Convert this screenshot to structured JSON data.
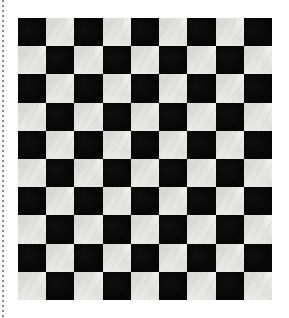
{
  "canvas": {
    "width": 289,
    "height": 318,
    "background_color": "#ffffff"
  },
  "guide_line": {
    "name": "dotted vertical guide",
    "orientation": "vertical",
    "x": 3,
    "y_start": 0,
    "y_end": 318,
    "style": "dotted",
    "color": "#8a8a8a",
    "thickness": 2
  },
  "checkerboard": {
    "title": "Checkerboard tile pattern",
    "columns": 9,
    "rows": 10,
    "cell_size": 28.2,
    "offset_x": 18,
    "offset_y": 18,
    "width": 254,
    "height": 282,
    "dark_color": "#070707",
    "light_color": "#f4f4f2",
    "top_left_cell": "dark",
    "texture": "marble",
    "grid": [
      [
        "dark",
        "light",
        "dark",
        "light",
        "dark",
        "light",
        "dark",
        "light",
        "dark"
      ],
      [
        "light",
        "dark",
        "light",
        "dark",
        "light",
        "dark",
        "light",
        "dark",
        "light"
      ],
      [
        "dark",
        "light",
        "dark",
        "light",
        "dark",
        "light",
        "dark",
        "light",
        "dark"
      ],
      [
        "light",
        "dark",
        "light",
        "dark",
        "light",
        "dark",
        "light",
        "dark",
        "light"
      ],
      [
        "dark",
        "light",
        "dark",
        "light",
        "dark",
        "light",
        "dark",
        "light",
        "dark"
      ],
      [
        "light",
        "dark",
        "light",
        "dark",
        "light",
        "dark",
        "light",
        "dark",
        "light"
      ],
      [
        "dark",
        "light",
        "dark",
        "light",
        "dark",
        "light",
        "dark",
        "light",
        "dark"
      ],
      [
        "light",
        "dark",
        "light",
        "dark",
        "light",
        "dark",
        "light",
        "dark",
        "light"
      ],
      [
        "dark",
        "light",
        "dark",
        "light",
        "dark",
        "light",
        "dark",
        "light",
        "dark"
      ],
      [
        "light",
        "dark",
        "light",
        "dark",
        "light",
        "dark",
        "light",
        "dark",
        "light"
      ]
    ]
  }
}
